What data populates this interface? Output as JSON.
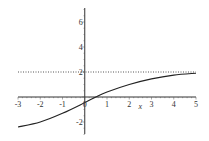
{
  "chart_data": {
    "type": "line",
    "title": "",
    "xlabel": "x",
    "ylabel": "",
    "xlim": [
      -3,
      5
    ],
    "ylim": [
      -3,
      7
    ],
    "grid": false,
    "legend": null,
    "x_ticks": [
      "-3",
      "-2",
      "-1",
      "0",
      "1",
      "2",
      "3",
      "4",
      "5"
    ],
    "y_ticks": [
      "-2",
      "2",
      "4",
      "6"
    ],
    "series": [
      {
        "name": "curve",
        "style": "solid",
        "color": "#222222",
        "x": [
          -3,
          -2,
          -1,
          0,
          0.5,
          1,
          2,
          3,
          4,
          5
        ],
        "y": [
          -2.4,
          -2.0,
          -1.3,
          -0.45,
          0,
          0.4,
          1.0,
          1.45,
          1.75,
          1.9
        ]
      },
      {
        "name": "asymptote",
        "style": "dotted",
        "color": "#555555",
        "x": [
          -3,
          5
        ],
        "y": [
          2,
          2
        ]
      }
    ]
  }
}
